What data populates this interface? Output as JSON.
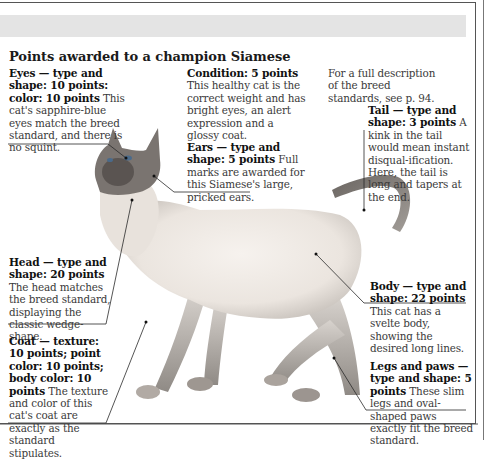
{
  "title": "Points awarded  to a champion Siamese",
  "reference": "For a full description of the breed standards, see p. 94.",
  "reference_lines": [
    "For a full description",
    "of the breed",
    "standards, see p. 94."
  ],
  "callouts": {
    "eyes": {
      "heading": "Eyes — type and shape: 10 points: color: 10 points",
      "text": "This cat's sapphire-blue eyes match the breed standard, and there is no squint."
    },
    "condition": {
      "heading": "Condition: 5 points",
      "text": "This healthy cat is the correct weight and has bright eyes, an alert expression and a glossy coat."
    },
    "ears": {
      "heading": "Ears — type and shape: 5 points",
      "text": "Full marks are awarded for this Siamese's large, pricked ears."
    },
    "tail": {
      "heading": "Tail — type and shape: 3 points",
      "text": "A kink in the tail would mean instant disqual-ification. Here, the tail is long and tapers at the end."
    },
    "head": {
      "heading": "Head — type and shape: 20 points",
      "text": "The head matches the breed standard, displaying the classic wedge-shape."
    },
    "body": {
      "heading": "Body — type and shape: 22 points",
      "text": "This cat has a svelte body, showing the desired long lines."
    },
    "coat": {
      "heading": "Coat — texture: 10 points; point color: 10 points; body color: 10 points",
      "text": "The texture and color of this cat's coat are exactly as the standard stipulates."
    },
    "legs": {
      "heading": "Legs and paws — type and shape: 5 points",
      "text": "These slim legs and oval-shaped paws exactly fit the breed standard."
    }
  },
  "illustration": {
    "subject": "Siamese cat",
    "description": "Seal-point Siamese cat standing, head raised, tail curled upward"
  },
  "colors": {
    "band": "#e4e4e4",
    "frame": "#555555",
    "text": "#3a3a3a",
    "heading": "#111111"
  }
}
